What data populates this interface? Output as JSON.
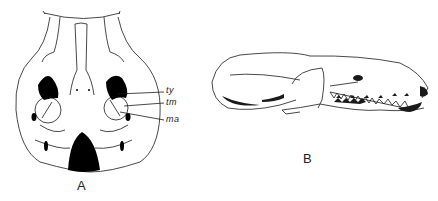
{
  "figure": {
    "panels": [
      {
        "id": "A",
        "label": "A",
        "view": "ventral view of skull",
        "annotations": [
          {
            "key": "ty",
            "text": "ty"
          },
          {
            "key": "tm",
            "text": "tm"
          },
          {
            "key": "ma",
            "text": "ma"
          }
        ]
      },
      {
        "id": "B",
        "label": "B",
        "view": "lateral view of skull"
      }
    ],
    "colors": {
      "ink": "#1a1a1a",
      "fill": "#000000",
      "background": "#ffffff"
    }
  }
}
